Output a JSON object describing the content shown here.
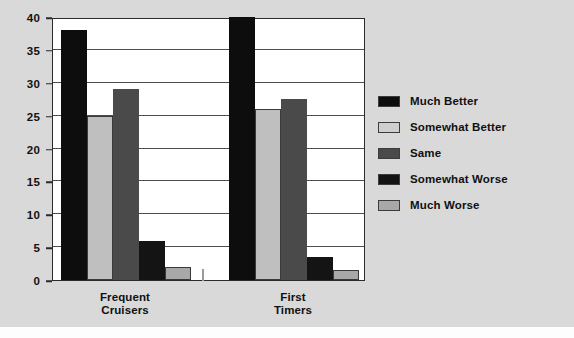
{
  "figure": {
    "background_color": "#d9d9d9",
    "plot_background_color": "#ffffff",
    "axis_color": "#2b2b2b"
  },
  "chart_data": {
    "type": "bar",
    "title": "",
    "subtitle": "",
    "xlabel": "",
    "ylabel": "",
    "categories": [
      "Frequent Cruisers",
      "First Timers"
    ],
    "category_label_lines": [
      [
        "Frequent",
        "Cruisers"
      ],
      [
        "First",
        "Timers"
      ]
    ],
    "ylim": [
      0,
      40
    ],
    "yticks": [
      0,
      5,
      10,
      15,
      20,
      25,
      30,
      35,
      40
    ],
    "ytick_labels": [
      "0",
      "5",
      "10",
      "15",
      "20",
      "25",
      "30",
      "35",
      "40"
    ],
    "grid": true,
    "grid_axis": "y",
    "legend_position": "right",
    "series": [
      {
        "name": "Much Better",
        "color": "#0d0d0d",
        "values": [
          38,
          40
        ]
      },
      {
        "name": "Somewhat Better",
        "color": "#bfbfbf",
        "values": [
          25,
          26
        ]
      },
      {
        "name": "Same",
        "color": "#4a4a4a",
        "values": [
          29,
          27.5
        ]
      },
      {
        "name": "Somewhat Worse",
        "color": "#141414",
        "values": [
          6,
          3.5
        ]
      },
      {
        "name": "Much Worse",
        "color": "#a8a8a8",
        "values": [
          2,
          1.5
        ]
      }
    ]
  },
  "legend": {
    "items": [
      {
        "label": "Much Better",
        "color": "#0d0d0d"
      },
      {
        "label": "Somewhat Better",
        "color": "#cfcfcf"
      },
      {
        "label": "Same",
        "color": "#4a4a4a"
      },
      {
        "label": "Somewhat Worse",
        "color": "#141414"
      },
      {
        "label": "Much Worse",
        "color": "#a8a8a8"
      }
    ]
  }
}
